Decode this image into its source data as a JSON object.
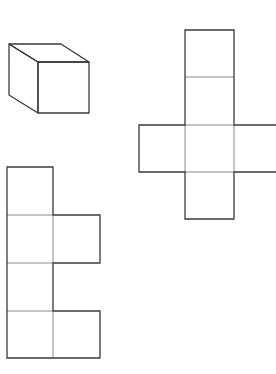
{
  "figure": {
    "stroke_color": "#3a3a3a",
    "inner_stroke_color": "#8a8a8a",
    "background": "#ffffff"
  },
  "cube": {
    "label": "cube",
    "front": {
      "x1": 38,
      "y1": 62,
      "x2": 89,
      "y2": 113
    },
    "back_top_left": [
      9,
      44
    ],
    "back_top_right": [
      61,
      44
    ],
    "back_bottom_left": [
      9,
      95
    ]
  },
  "cross_net": {
    "label": "cross-shaped net",
    "cell": 47,
    "column_x": 185,
    "rows_y": [
      30,
      77,
      125,
      172,
      219
    ],
    "arm_left_x": 139,
    "arm_right_end_x": 276
  },
  "side_net": {
    "label": "side net",
    "cell": 47,
    "left_x": 7,
    "rows_y": [
      167,
      215,
      263,
      311,
      358
    ],
    "right_cells_rows": [
      1,
      3
    ]
  }
}
